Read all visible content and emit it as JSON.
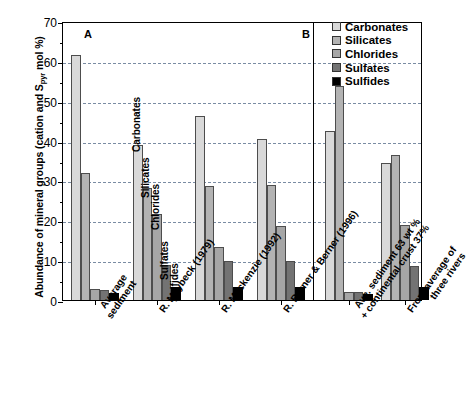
{
  "chart_data": {
    "type": "bar",
    "title": "",
    "xlabel": "",
    "ylabel": "Abundance of mineral groups (cation and Spyr mol %)",
    "ylabel_prefix": "Abundance of mineral groups (cation and S",
    "ylabel_sub": "pyr",
    "ylabel_suffix": " mol %)",
    "ylim": [
      0,
      70
    ],
    "yticks": [
      0,
      10,
      20,
      30,
      40,
      50,
      60,
      70
    ],
    "ytick_labels": [
      "0",
      "10",
      "20",
      "30",
      "40",
      "50",
      "60",
      "70"
    ],
    "yminor_step": 5,
    "grid": "horizontal-dashed",
    "grid_color": "#7a8ca3",
    "legend_position": "top-right",
    "categories": [
      "Average\nsediment",
      "R. Meybeck (1979)",
      "R. Mackenzie (1992)",
      "R. Berner & Berner (1996)",
      "Ave. sediment 63 wt %\n+ continental crust 37%",
      "From average of\nthree rivers"
    ],
    "series": [
      {
        "name": "Carbonates",
        "color": "#d9d9d9",
        "values": [
          61.5,
          39.0,
          46.2,
          40.3,
          42.3,
          34.5
        ]
      },
      {
        "name": "Silicates",
        "color": "#b3b3b3",
        "values": [
          31.8,
          28.0,
          28.5,
          28.8,
          53.7,
          36.3
        ]
      },
      {
        "name": "Chlorides",
        "color": "#a6a6a6",
        "values": [
          2.7,
          21.5,
          13.3,
          18.5,
          2.1,
          18.8
        ]
      },
      {
        "name": "Sulfates",
        "color": "#737373",
        "values": [
          2.5,
          8.8,
          9.7,
          9.7,
          2.0,
          8.5
        ]
      },
      {
        "name": "Sulfides",
        "color": "#000000",
        "values": [
          1.8,
          3.2,
          3.2,
          3.3,
          1.6,
          3.3
        ]
      }
    ],
    "annotations": [
      {
        "text": "Carbonates",
        "group": 1,
        "series": 0
      },
      {
        "text": "Silicates",
        "group": 1,
        "series": 1
      },
      {
        "text": "Chlorides",
        "group": 1,
        "series": 2
      },
      {
        "text": "Sulfates",
        "group": 1,
        "series": 3
      },
      {
        "text": "Sulfides",
        "group": 1,
        "series": 4
      }
    ],
    "panels": [
      {
        "label": "A",
        "groups": [
          0,
          1,
          2,
          3
        ]
      },
      {
        "label": "B",
        "groups": [
          4,
          5
        ]
      }
    ]
  },
  "legend": {
    "items": [
      {
        "label": "Carbonates",
        "color": "#d9d9d9"
      },
      {
        "label": "Silicates",
        "color": "#b3b3b3"
      },
      {
        "label": "Chlorides",
        "color": "#a6a6a6"
      },
      {
        "label": "Sulfates",
        "color": "#737373"
      },
      {
        "label": "Sulfides",
        "color": "#000000"
      }
    ]
  },
  "panel_labels": {
    "a": "A",
    "b": "B"
  }
}
